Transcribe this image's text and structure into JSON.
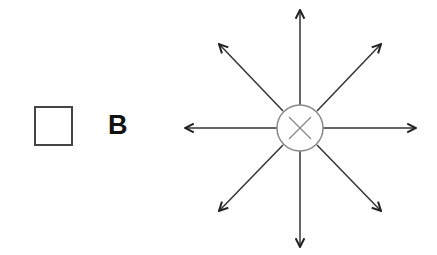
{
  "legend": {
    "symbol": "empty-square",
    "label": "B"
  },
  "diagram": {
    "center_symbol": "circle-with-x",
    "arrow_directions": [
      "up",
      "up-right",
      "right",
      "down-right",
      "down",
      "down-left",
      "left",
      "up-left"
    ],
    "colors": {
      "arrow": "#222222",
      "circle": "#888888",
      "square_border": "#444444",
      "label": "#111111"
    }
  }
}
